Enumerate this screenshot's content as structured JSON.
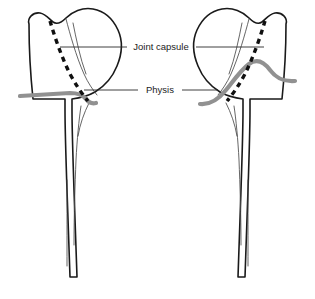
{
  "figure": {
    "title": "Proximal femur diagram: joint capsule and physis",
    "background_color": "#ffffff",
    "width": 315,
    "height": 299
  },
  "labels": {
    "joint_capsule": "Joint capsule",
    "physis": "Physis"
  },
  "legend_colors": {
    "capsule_line": "#101010",
    "physis_line": "#919191",
    "bone_outline": "#1a1a1a",
    "leader_line": "#2b2b2b"
  },
  "structures": [
    {
      "name": "left-femur",
      "side": "left",
      "description": "Proximal femur, head and greater trochanter oriented with head to the right"
    },
    {
      "name": "right-femur",
      "side": "right",
      "description": "Proximal femur mirrored, head to the left and greater trochanter to the right"
    }
  ],
  "annotations": [
    {
      "label": "Joint capsule",
      "marker": "dashed-black-line",
      "points_to": [
        "left-femur",
        "right-femur"
      ]
    },
    {
      "label": "Physis",
      "marker": "solid-gray-line",
      "points_to": [
        "left-femur",
        "right-femur"
      ]
    }
  ]
}
